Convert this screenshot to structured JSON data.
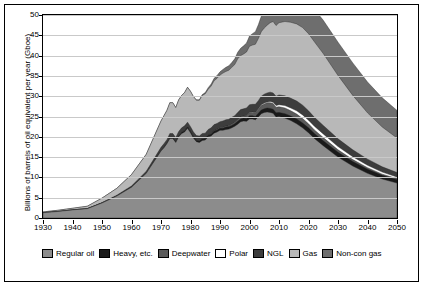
{
  "chart_data": {
    "type": "area",
    "title": "",
    "xlabel": "",
    "ylabel": "Billions of barrels of oil equivalent per year (Gboe)",
    "xlim": [
      1930,
      2050
    ],
    "ylim": [
      0,
      50
    ],
    "grid": true,
    "stacked": true,
    "legend_position": "bottom",
    "xticks": [
      1930,
      1940,
      1950,
      1960,
      1970,
      1980,
      1990,
      2000,
      2010,
      2020,
      2030,
      2040,
      2050
    ],
    "yticks": [
      0,
      5,
      10,
      15,
      20,
      25,
      30,
      35,
      40,
      45,
      50
    ],
    "x": [
      1930,
      1935,
      1940,
      1945,
      1950,
      1955,
      1960,
      1965,
      1970,
      1971,
      1972,
      1973,
      1974,
      1975,
      1976,
      1977,
      1978,
      1979,
      1980,
      1981,
      1982,
      1983,
      1984,
      1985,
      1986,
      1987,
      1988,
      1989,
      1990,
      1991,
      1992,
      1993,
      1994,
      1995,
      1996,
      1997,
      1998,
      1999,
      2000,
      2001,
      2002,
      2003,
      2004,
      2005,
      2006,
      2007,
      2008,
      2009,
      2010,
      2012,
      2014,
      2016,
      2018,
      2020,
      2022,
      2025,
      2030,
      2035,
      2040,
      2045,
      2050
    ],
    "series": [
      {
        "name": "Regular oil",
        "color": "#8c8c8c",
        "values": [
          1.3,
          1.6,
          2.0,
          2.3,
          3.7,
          5.4,
          7.6,
          11.0,
          16.5,
          17.3,
          18.3,
          19.6,
          19.6,
          18.6,
          20.0,
          20.8,
          21.2,
          22.1,
          21.0,
          19.7,
          18.8,
          18.6,
          19.1,
          19.2,
          20.0,
          20.2,
          20.9,
          21.2,
          21.6,
          21.6,
          21.8,
          21.9,
          22.2,
          22.6,
          23.1,
          23.7,
          23.9,
          23.8,
          24.4,
          24.4,
          24.2,
          24.9,
          25.7,
          26.0,
          26.1,
          26.0,
          25.8,
          24.9,
          25.0,
          24.6,
          24.0,
          23.2,
          22.2,
          21.0,
          19.6,
          17.8,
          15.0,
          12.8,
          11.0,
          9.6,
          8.6
        ]
      },
      {
        "name": "Heavy, etc.",
        "color": "#1a1a1a",
        "values": [
          0,
          0,
          0,
          0,
          0,
          0,
          0,
          0,
          0.1,
          0.1,
          0.1,
          0.2,
          0.2,
          0.2,
          0.2,
          0.3,
          0.3,
          0.3,
          0.3,
          0.3,
          0.3,
          0.4,
          0.4,
          0.4,
          0.4,
          0.5,
          0.5,
          0.5,
          0.5,
          0.5,
          0.6,
          0.6,
          0.6,
          0.6,
          0.7,
          0.7,
          0.7,
          0.7,
          0.8,
          0.8,
          0.8,
          0.9,
          0.9,
          0.9,
          1.0,
          1.0,
          1.0,
          1.0,
          1.0,
          1.1,
          1.1,
          1.2,
          1.2,
          1.2,
          1.2,
          1.2,
          1.2,
          1.1,
          1.0,
          0.9,
          0.8
        ]
      },
      {
        "name": "Deepwater",
        "color": "#5a5a5a",
        "values": [
          0,
          0,
          0,
          0,
          0,
          0,
          0,
          0,
          0,
          0,
          0,
          0,
          0,
          0,
          0,
          0,
          0,
          0,
          0,
          0,
          0,
          0,
          0,
          0,
          0,
          0.1,
          0.1,
          0.1,
          0.1,
          0.2,
          0.2,
          0.2,
          0.3,
          0.3,
          0.4,
          0.5,
          0.5,
          0.6,
          0.7,
          0.8,
          0.9,
          1.0,
          1.1,
          1.2,
          1.3,
          1.4,
          1.4,
          1.4,
          1.4,
          1.4,
          1.3,
          1.2,
          1.1,
          1.0,
          0.9,
          0.8,
          0.6,
          0.5,
          0.4,
          0.3,
          0.3
        ]
      },
      {
        "name": "Polar",
        "color": "#ffffff",
        "values": [
          0,
          0,
          0,
          0,
          0,
          0,
          0,
          0,
          0,
          0,
          0,
          0,
          0,
          0,
          0,
          0,
          0,
          0,
          0,
          0,
          0,
          0,
          0,
          0,
          0,
          0,
          0,
          0,
          0,
          0,
          0,
          0,
          0,
          0,
          0,
          0,
          0,
          0.1,
          0.1,
          0.1,
          0.1,
          0.1,
          0.2,
          0.2,
          0.2,
          0.3,
          0.3,
          0.4,
          0.5,
          0.6,
          0.7,
          0.8,
          0.9,
          0.9,
          0.9,
          0.9,
          0.8,
          0.7,
          0.6,
          0.5,
          0.4
        ]
      },
      {
        "name": "NGL",
        "color": "#3d3d3d",
        "values": [
          0,
          0,
          0,
          0,
          0.1,
          0.2,
          0.3,
          0.5,
          0.8,
          0.9,
          0.9,
          1.0,
          1.0,
          1.0,
          1.1,
          1.1,
          1.2,
          1.2,
          1.2,
          1.2,
          1.2,
          1.2,
          1.3,
          1.3,
          1.4,
          1.4,
          1.5,
          1.5,
          1.5,
          1.6,
          1.6,
          1.6,
          1.7,
          1.7,
          1.8,
          1.8,
          1.8,
          1.9,
          1.9,
          1.9,
          2.0,
          2.0,
          2.1,
          2.2,
          2.2,
          2.3,
          2.3,
          2.3,
          2.4,
          2.4,
          2.4,
          2.4,
          2.4,
          2.3,
          2.2,
          2.1,
          1.9,
          1.7,
          1.5,
          1.3,
          1.1
        ]
      },
      {
        "name": "Gas",
        "color": "#b8b8b8",
        "values": [
          0.2,
          0.3,
          0.4,
          0.6,
          1.1,
          1.7,
          2.8,
          4.2,
          6.5,
          6.9,
          7.2,
          7.6,
          7.6,
          7.4,
          7.8,
          8.0,
          8.2,
          8.6,
          8.7,
          8.7,
          8.7,
          8.8,
          9.4,
          9.7,
          9.9,
          10.3,
          10.8,
          11.1,
          11.5,
          11.8,
          11.9,
          12.1,
          12.3,
          12.6,
          13.2,
          13.3,
          13.5,
          13.8,
          14.4,
          14.6,
          14.8,
          15.3,
          15.9,
          16.3,
          16.7,
          17.1,
          17.6,
          17.4,
          17.8,
          18.3,
          18.7,
          19.0,
          19.1,
          19.0,
          18.6,
          17.7,
          15.6,
          13.4,
          11.4,
          9.8,
          8.5
        ]
      },
      {
        "name": "Non-con gas",
        "color": "#6e6e6e",
        "values": [
          0,
          0,
          0,
          0,
          0,
          0,
          0,
          0,
          0,
          0,
          0,
          0,
          0,
          0,
          0,
          0,
          0,
          0,
          0,
          0,
          0.1,
          0.1,
          0.2,
          0.3,
          0.4,
          0.5,
          0.6,
          0.7,
          0.8,
          0.9,
          1.0,
          1.1,
          1.2,
          1.4,
          1.6,
          1.8,
          2.0,
          2.2,
          2.5,
          2.8,
          3.1,
          3.4,
          3.8,
          4.2,
          4.5,
          4.8,
          5.2,
          5.4,
          5.7,
          6.2,
          6.7,
          7.1,
          7.5,
          7.8,
          8.0,
          8.2,
          8.2,
          8.0,
          7.6,
          7.2,
          6.8
        ]
      }
    ],
    "legend": [
      {
        "label": "Regular oil",
        "color": "#8c8c8c"
      },
      {
        "label": "Heavy, etc.",
        "color": "#1a1a1a"
      },
      {
        "label": "Deepwater",
        "color": "#5a5a5a"
      },
      {
        "label": "Polar",
        "color": "#ffffff"
      },
      {
        "label": "NGL",
        "color": "#3d3d3d"
      },
      {
        "label": "Gas",
        "color": "#b8b8b8"
      },
      {
        "label": "Non-con gas",
        "color": "#6e6e6e"
      }
    ]
  }
}
